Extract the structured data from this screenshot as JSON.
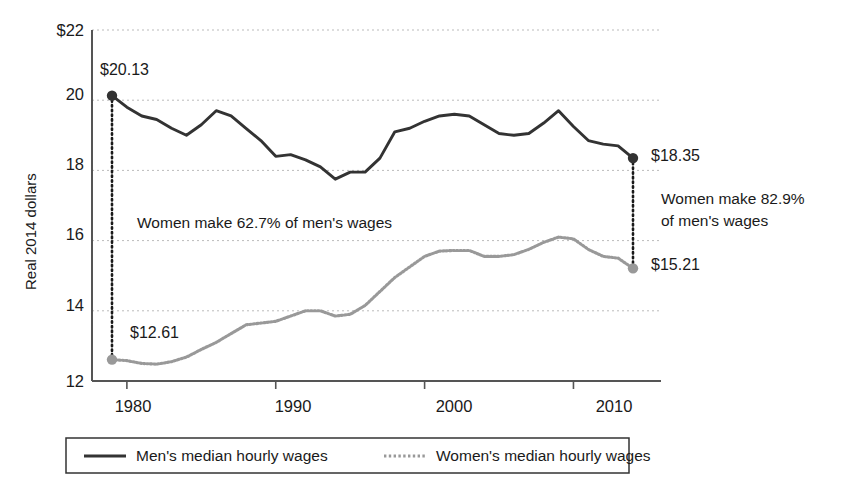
{
  "chart_data": {
    "type": "line",
    "title": "",
    "subtitle": "",
    "xlabel": "",
    "ylabel": "Real 2014 dollars",
    "xlim": [
      1979,
      2014
    ],
    "ylim": [
      12,
      22
    ],
    "grid": true,
    "y_ticks": [
      12,
      14,
      16,
      18,
      20,
      22
    ],
    "y_tick_labels": [
      "12",
      "14",
      "16",
      "18",
      "20",
      "$22"
    ],
    "x_ticks": [
      1980,
      1990,
      2000,
      2010
    ],
    "x_tick_labels": [
      "1980",
      "1990",
      "2000",
      "2010"
    ],
    "legend_position": "bottom",
    "x": [
      1979,
      1980,
      1981,
      1982,
      1983,
      1984,
      1985,
      1986,
      1987,
      1988,
      1989,
      1990,
      1991,
      1992,
      1993,
      1994,
      1995,
      1996,
      1997,
      1998,
      1999,
      2000,
      2001,
      2002,
      2003,
      2004,
      2005,
      2006,
      2007,
      2008,
      2009,
      2010,
      2011,
      2012,
      2013,
      2014
    ],
    "series": [
      {
        "name": "Men's median hourly wages",
        "color": "#333333",
        "style": "solid",
        "values": [
          20.13,
          19.8,
          19.55,
          19.45,
          19.2,
          19.0,
          19.3,
          19.7,
          19.55,
          19.2,
          18.85,
          18.4,
          18.45,
          18.3,
          18.1,
          17.75,
          17.95,
          17.95,
          18.35,
          19.1,
          19.2,
          19.4,
          19.55,
          19.6,
          19.55,
          19.3,
          19.05,
          19.0,
          19.05,
          19.35,
          19.7,
          19.25,
          18.85,
          18.75,
          18.7,
          18.35
        ]
      },
      {
        "name": "Women's median hourly wages",
        "color": "#999999",
        "style": "dotted",
        "values": [
          12.61,
          12.58,
          12.5,
          12.48,
          12.55,
          12.68,
          12.9,
          13.1,
          13.35,
          13.6,
          13.65,
          13.7,
          13.85,
          14.0,
          14.0,
          13.85,
          13.9,
          14.15,
          14.55,
          14.95,
          15.25,
          15.55,
          15.7,
          15.72,
          15.72,
          15.55,
          15.55,
          15.6,
          15.75,
          15.95,
          16.1,
          16.05,
          15.75,
          15.55,
          15.5,
          15.21
        ]
      }
    ],
    "annotations": [
      {
        "name": "mens-start-value",
        "text": "$20.13",
        "x": 1979,
        "y": 20.13
      },
      {
        "name": "womens-start-value",
        "text": "$12.61",
        "x": 1979,
        "y": 12.61
      },
      {
        "name": "mens-end-value",
        "text": "$18.35",
        "x": 2014,
        "y": 18.35
      },
      {
        "name": "womens-end-value",
        "text": "$15.21",
        "x": 2014,
        "y": 15.21
      },
      {
        "name": "ratio-start",
        "text": "Women make 62.7% of men's wages"
      },
      {
        "name": "ratio-end-line1",
        "text": "Women make 82.9%"
      },
      {
        "name": "ratio-end-line2",
        "text": "of men's wages"
      }
    ]
  },
  "axis": {
    "y_label": "Real 2014 dollars",
    "y_tick_22": "$22",
    "y_tick_20": "20",
    "y_tick_18": "18",
    "y_tick_16": "16",
    "y_tick_14": "14",
    "y_tick_12": "12",
    "x_tick_1980": "1980",
    "x_tick_1990": "1990",
    "x_tick_2000": "2000",
    "x_tick_2010": "2010"
  },
  "labels": {
    "mens_start": "$20.13",
    "womens_start": "$12.61",
    "mens_end": "$18.35",
    "womens_end": "$15.21",
    "ratio_start": "Women make 62.7% of men's wages",
    "ratio_end_line1": "Women make 82.9%",
    "ratio_end_line2": "of men's wages"
  },
  "legend": {
    "men_label": "Men's median hourly wages",
    "women_label": "Women's median hourly wages"
  },
  "colors": {
    "men_line": "#333333",
    "women_line": "#999999",
    "grid": "#bbbbbb",
    "axis": "#555555",
    "text": "#1a1a1a"
  }
}
